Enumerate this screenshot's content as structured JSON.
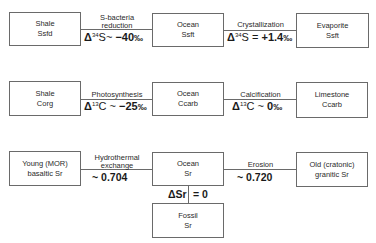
{
  "rows": [
    {
      "left": {
        "line1": "Shale",
        "line2": "Ssfd"
      },
      "mid": {
        "line1": "Ocean",
        "line2": "Ssft"
      },
      "right": {
        "line1": "Evaporite",
        "line2": "Ssft"
      },
      "left_process": {
        "line1": "S-bacteria",
        "line2": "reduction"
      },
      "left_delta": {
        "symbol": "Δ",
        "iso": "34",
        "elem": "S~ ",
        "value": "−40",
        "unit": "‰"
      },
      "right_process": {
        "line1": "Crystallization"
      },
      "right_delta": {
        "symbol": "Δ",
        "iso": "34",
        "elem": "S = ",
        "value": "+1.4",
        "unit": "‰"
      }
    },
    {
      "left": {
        "line1": "Shale",
        "line2": "Corg"
      },
      "mid": {
        "line1": "Ocean",
        "line2": "Ccarb"
      },
      "right": {
        "line1": "Limestone",
        "line2": "Ccarb"
      },
      "left_process": {
        "line1": "Photosynthesis"
      },
      "left_delta": {
        "symbol": "Δ",
        "iso": "13",
        "elem": "C ~ ",
        "value": "−25",
        "unit": "‰"
      },
      "right_process": {
        "line1": "Calcification"
      },
      "right_delta": {
        "symbol": "Δ",
        "iso": "13",
        "elem": "C ~ ",
        "value": "0",
        "unit": "‰"
      }
    },
    {
      "left": {
        "line1": "Young (MOR)",
        "line2": "basaltic Sr"
      },
      "mid": {
        "line1": "Ocean",
        "line2": "Sr"
      },
      "right": {
        "line1": "Old (cratonic)",
        "line2": "granitic Sr"
      },
      "left_process": {
        "line1": "Hydrothermal",
        "line2": "exchange"
      },
      "left_value": "~ 0.704",
      "right_process": {
        "line1": "Erosion"
      },
      "right_value": "~ 0.720"
    }
  ],
  "fossil": {
    "line1": "Fossil",
    "line2": "Sr",
    "delta_label": "ΔSr",
    "delta_value": "= 0"
  }
}
